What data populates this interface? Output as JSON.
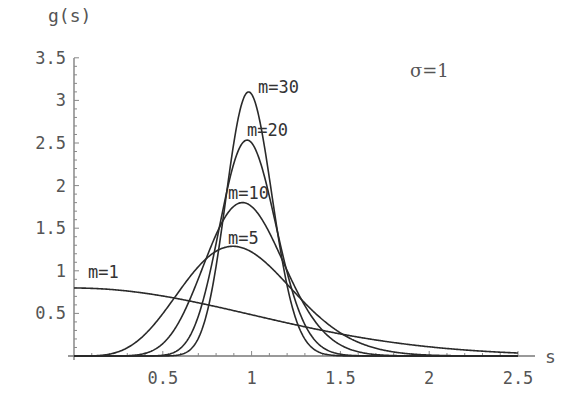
{
  "chart_data": {
    "type": "line",
    "title": "",
    "xlabel": "s",
    "ylabel": "g(s)",
    "xlim": [
      0,
      2.55
    ],
    "ylim": [
      0,
      3.5
    ],
    "grid": false,
    "annotation": "σ=1",
    "x_ticks": [
      "0.5",
      "1",
      "1.5",
      "2",
      "2.5"
    ],
    "y_ticks": [
      "0.5",
      "1",
      "1.5",
      "2",
      "2.5",
      "3",
      "3.5"
    ],
    "x_range_curves": [
      0,
      2.5
    ],
    "series": [
      {
        "name": "m=1",
        "m": 1,
        "label": "m=1",
        "peak_x": 0.0,
        "peak_y": 0.8
      },
      {
        "name": "m=5",
        "m": 5,
        "label": "m=5",
        "peak_x": 0.9,
        "peak_y": 1.3
      },
      {
        "name": "m=10",
        "m": 10,
        "label": "m=10",
        "peak_x": 0.95,
        "peak_y": 1.8
      },
      {
        "name": "m=20",
        "m": 20,
        "label": "m=20",
        "peak_x": 0.98,
        "peak_y": 2.53
      },
      {
        "name": "m=30",
        "m": 30,
        "label": "m=30",
        "peak_x": 0.98,
        "peak_y": 3.09
      }
    ]
  }
}
